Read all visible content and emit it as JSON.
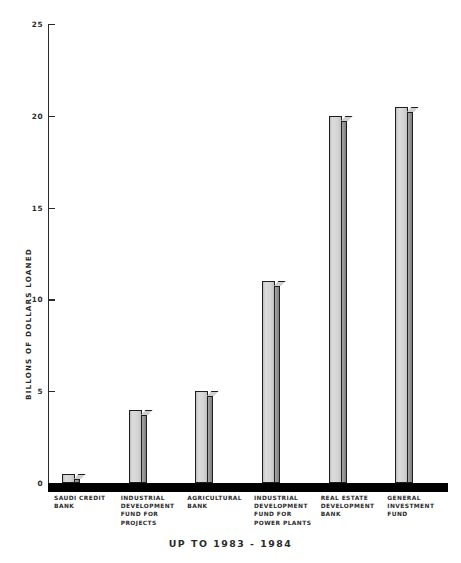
{
  "chart_data": {
    "type": "bar",
    "title": "",
    "subtitle": "",
    "xlabel": "UP TO 1983 - 1984",
    "ylabel": "BILLONS OF DOLLARS LOANED",
    "categories": [
      "SAUDI CREDIT BANK",
      "INDUSTRIAL DEVELOPMENT FUND FOR PROJECTS",
      "AGRICULTURAL BANK",
      "INDUSTRIAL DEVELOPMENT FUND FOR POWER PLANTS",
      "REAL ESTATE DEVELOPMENT BANK",
      "GENERAL INVESTMENT FUND"
    ],
    "category_lines": [
      [
        "SAUDI CREDIT",
        "BANK"
      ],
      [
        "INDUSTRIAL",
        "DEVELOPMENT",
        "FUND FOR",
        "PROJECTS"
      ],
      [
        "AGRICULTURAL",
        "BANK"
      ],
      [
        "INDUSTRIAL",
        "DEVELOPMENT",
        "FUND FOR",
        "POWER PLANTS"
      ],
      [
        "REAL ESTATE",
        "DEVELOPMENT",
        "BANK"
      ],
      [
        "GENERAL",
        "INVESTMENT",
        "FUND"
      ]
    ],
    "values": [
      0.5,
      4,
      5,
      11,
      20,
      20.5
    ],
    "ylim": [
      0,
      25
    ],
    "yticks": [
      0,
      5,
      10,
      15,
      20,
      25
    ],
    "ytick_labels": [
      "0",
      "5",
      "10",
      "15",
      "20",
      "25"
    ],
    "grid": false,
    "legend": "none",
    "bar_face_color": "#d2d2d2",
    "bar_side_color": "#8f8f8f",
    "bar_edge_color": "#1e1e1e",
    "baseline_color": "#000000",
    "axis_color": "#2a2a2a",
    "background_color": "#ffffff"
  }
}
